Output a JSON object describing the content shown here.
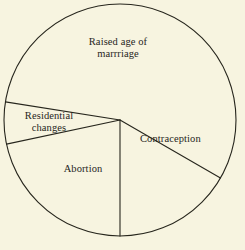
{
  "figure": {
    "background_color": "#f7f4e0",
    "stroke_color": "#27261d",
    "text_color": "#27261d"
  },
  "chart_data": {
    "type": "pie",
    "title": "",
    "subtitle": "",
    "xlabel": "",
    "ylabel": "",
    "grid": false,
    "legend": "none",
    "labels_position": "inside-slice",
    "geometry": {
      "center_x": 120,
      "center_y": 120,
      "radius": 116,
      "start_angle_deg": 120,
      "direction": "clockwise",
      "boundary_angles_deg": [
        120,
        180,
        258,
        279
      ]
    },
    "categories": [
      "Contraception",
      "Abortion",
      "Residential changes",
      "Raised age of marrriage"
    ],
    "values": [
      60,
      78,
      21,
      201
    ],
    "value_unit": "degrees",
    "percentages": [
      16.7,
      21.7,
      5.8,
      55.8
    ],
    "slices": [
      {
        "label": "Contraception",
        "label_lines": [
          "Contraception"
        ],
        "angle_deg": 60,
        "percent": 16.7,
        "start_deg": 120,
        "end_deg": 180,
        "fill": "#f7f4e0"
      },
      {
        "label": "Abortion",
        "label_lines": [
          "Abortion"
        ],
        "angle_deg": 78,
        "percent": 21.7,
        "start_deg": 180,
        "end_deg": 258,
        "fill": "#f7f4e0"
      },
      {
        "label": "Residential changes",
        "label_lines": [
          "Residential",
          "changes"
        ],
        "angle_deg": 21,
        "percent": 5.8,
        "start_deg": 258,
        "end_deg": 279,
        "fill": "#f7f4e0"
      },
      {
        "label": "Raised age of marrriage",
        "label_lines": [
          "Raised age of",
          "marrriage"
        ],
        "angle_deg": 201,
        "percent": 55.8,
        "start_deg": 279,
        "end_deg": 480,
        "fill": "#f7f4e0"
      }
    ]
  },
  "labels": {
    "raised_age": "Raised age of\nmarrriage",
    "contraception": "Contraception",
    "residential": "Residential\nchanges",
    "abortion": "Abortion"
  }
}
